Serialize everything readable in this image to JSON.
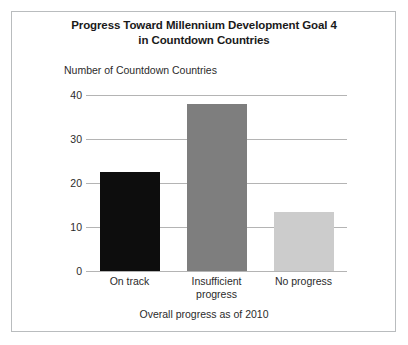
{
  "figure": {
    "background_color": "#ffffff",
    "border_color": "#b9bcbe"
  },
  "chart_data": {
    "type": "bar",
    "title": "Progress Toward Millennium Development Goal 4 in Countdown Countries",
    "title_line_1": "Progress Toward Millennium Development Goal 4",
    "title_line_2": "in Countdown Countries",
    "subtitle": "",
    "xlabel": "",
    "ylabel": "Number of Countdown Countries",
    "categories": [
      "On track",
      "Insufficient progress",
      "No progress"
    ],
    "values": [
      22.5,
      38,
      13.5
    ],
    "bar_colors": [
      "#0d0d0d",
      "#7e7e7e",
      "#cccccc"
    ],
    "ylim": [
      0,
      40
    ],
    "yticks": [
      0,
      10,
      20,
      30,
      40
    ],
    "ytick_labels": [
      "0",
      "10",
      "20",
      "30",
      "40"
    ],
    "xtick_labels": [
      [
        "On track"
      ],
      [
        "Insufficient",
        "progress"
      ],
      [
        "No progress"
      ]
    ],
    "grid": true,
    "grid_color": "#b4b4b4",
    "legend": false,
    "legend_position": "none",
    "annotation": "Overall progress as of 2010"
  },
  "footer": {
    "caption": "Overall progress as of 2010"
  }
}
